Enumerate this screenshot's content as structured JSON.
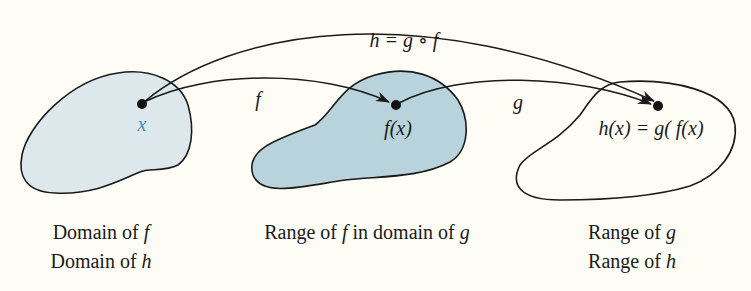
{
  "diagram": {
    "colors": {
      "background": "#fdfdf6",
      "domain_fill": "#dce8ec",
      "range_f_fill": "#b8d3dc",
      "outline": "#1a1a1a",
      "x_label": "#3d8fc4"
    },
    "composition_label": "h = g ∘ f",
    "arrow_f_label": "f",
    "arrow_g_label": "g",
    "points": {
      "x": "x",
      "fx": "f(x)",
      "hx": "h(x) = g( f(x)"
    },
    "regions": [
      {
        "id": "domain",
        "lines": [
          "Domain of f",
          "Domain of h"
        ],
        "fill": "#dce8ec"
      },
      {
        "id": "middle",
        "lines": [
          "Range of f in domain of g"
        ],
        "fill": "#b8d3dc"
      },
      {
        "id": "range",
        "lines": [
          "Range of g",
          "Range of h"
        ],
        "fill": "none"
      }
    ],
    "captions": {
      "domain_line1_prefix": "Domain of ",
      "domain_line1_var": "f",
      "domain_line2_prefix": "Domain of ",
      "domain_line2_var": "h",
      "middle_prefix": "Range of ",
      "middle_var1": "f",
      "middle_mid": " in domain of ",
      "middle_var2": "g",
      "range_line1_prefix": "Range of ",
      "range_line1_var": "g",
      "range_line2_prefix": "Range of ",
      "range_line2_var": "h"
    }
  }
}
